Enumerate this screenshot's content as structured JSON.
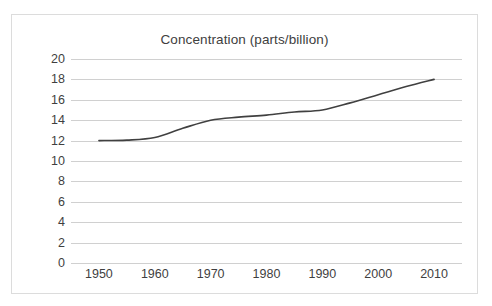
{
  "chart_data": {
    "type": "line",
    "title": "Concentration (parts/billion)",
    "xlabel": "",
    "ylabel": "",
    "xlim": [
      1945,
      2015
    ],
    "ylim": [
      0,
      20
    ],
    "y_tick_step": 2,
    "grid": "horizontal",
    "legend": "none",
    "line_color": "#404040",
    "x_tick_labels": [
      "1950",
      "1960",
      "1970",
      "1980",
      "1990",
      "2000",
      "2010"
    ],
    "y_tick_labels": [
      "20",
      "18",
      "16",
      "14",
      "12",
      "10",
      "8",
      "6",
      "4",
      "2",
      "0"
    ],
    "x": [
      1950,
      1955,
      1960,
      1965,
      1970,
      1975,
      1980,
      1985,
      1990,
      1995,
      2000,
      2005,
      2010
    ],
    "series": [
      {
        "name": "Concentration",
        "values": [
          12.0,
          12.05,
          12.3,
          13.2,
          14.0,
          14.3,
          14.5,
          14.8,
          15.0,
          15.7,
          16.5,
          17.3,
          18.0
        ]
      }
    ],
    "annotations": []
  },
  "frame": {
    "ghost_text": "",
    "border_color": "#dcdcdc"
  }
}
